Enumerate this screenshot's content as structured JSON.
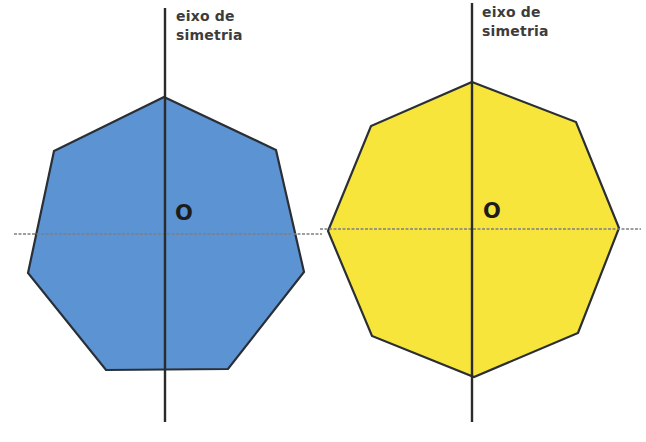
{
  "figures": [
    {
      "name": "heptagon",
      "sides": 7,
      "fill": "#5b93d3",
      "stroke": "#2a2f36",
      "vertices": [
        [
          164,
          97
        ],
        [
          276,
          150
        ],
        [
          304,
          272
        ],
        [
          228,
          369
        ],
        [
          106,
          370
        ],
        [
          28,
          273
        ],
        [
          54,
          151
        ]
      ],
      "axis_label": {
        "line1": "eixo de",
        "line2": "simetria"
      },
      "center_label": "O",
      "vertical_axis": {
        "x": 165,
        "y1": 8,
        "y2": 422
      },
      "horizontal_axis": {
        "y": 234,
        "x1": 14,
        "x2": 322
      }
    },
    {
      "name": "octagon",
      "sides": 8,
      "fill": "#f8e53c",
      "stroke": "#2a2f36",
      "vertices": [
        [
          472,
          82
        ],
        [
          576,
          122
        ],
        [
          619,
          228
        ],
        [
          578,
          333
        ],
        [
          474,
          377
        ],
        [
          372,
          336
        ],
        [
          328,
          231
        ],
        [
          371,
          126
        ]
      ],
      "axis_label": {
        "line1": "eixo de",
        "line2": "simetria"
      },
      "center_label": "O",
      "vertical_axis": {
        "x": 472,
        "y1": 3,
        "y2": 422
      },
      "horizontal_axis": {
        "y": 229,
        "x1": 320,
        "x2": 641
      }
    }
  ],
  "colors": {
    "axis_solid": "#2b2b2b",
    "axis_dashed": "#7d7f86",
    "label_text": "#3c3c3c"
  }
}
